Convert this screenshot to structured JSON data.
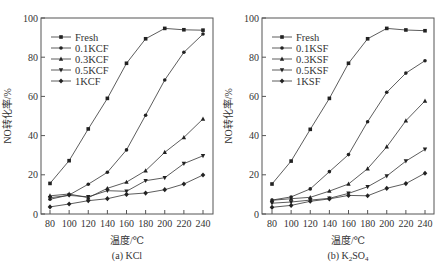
{
  "chart_data": [
    {
      "type": "line",
      "caption": "(a) KCl",
      "xlabel": "温度/℃",
      "ylabel": "NO转化率/%",
      "x": [
        80,
        100,
        120,
        140,
        160,
        180,
        200,
        220,
        240
      ],
      "x_ticks": [
        "80",
        "100",
        "120",
        "140",
        "160",
        "180",
        "200",
        "220",
        "240"
      ],
      "y_ticks": [
        "0",
        "20",
        "40",
        "60",
        "80",
        "100"
      ],
      "ylim": [
        0,
        100
      ],
      "xlim": [
        70,
        250
      ],
      "grid": false,
      "legend_position": "upper left",
      "series": [
        {
          "name": "Fresh",
          "marker": "square",
          "values": [
            15.6,
            27.2,
            43.4,
            59.0,
            76.9,
            89.4,
            94.7,
            94.0,
            93.8
          ]
        },
        {
          "name": "0.1KCF",
          "marker": "circle",
          "values": [
            7.5,
            9.7,
            15.2,
            21.3,
            32.7,
            50.4,
            68.4,
            82.5,
            91.8
          ]
        },
        {
          "name": "0.3KCF",
          "marker": "triangle-up",
          "values": [
            9.3,
            10.2,
            8.3,
            13.1,
            16.3,
            22.1,
            31.5,
            39.1,
            48.5
          ]
        },
        {
          "name": "0.5KCF",
          "marker": "triangle-down",
          "values": [
            8.3,
            9.5,
            8.8,
            11.9,
            11.6,
            17.0,
            18.5,
            25.7,
            29.7
          ]
        },
        {
          "name": "1KCF",
          "marker": "diamond",
          "values": [
            3.6,
            5.1,
            6.8,
            7.8,
            10.0,
            10.7,
            12.4,
            15.3,
            19.9
          ]
        }
      ]
    },
    {
      "type": "line",
      "caption": "(b) K₂SO₄",
      "xlabel": "温度/℃",
      "ylabel": "NO转化率/%",
      "x": [
        80,
        100,
        120,
        140,
        160,
        180,
        200,
        220,
        240
      ],
      "x_ticks": [
        "80",
        "100",
        "120",
        "140",
        "160",
        "180",
        "200",
        "220",
        "240"
      ],
      "y_ticks": [
        "0",
        "20",
        "40",
        "60",
        "80",
        "100"
      ],
      "ylim": [
        0,
        100
      ],
      "xlim": [
        70,
        250
      ],
      "grid": false,
      "legend_position": "upper left",
      "series": [
        {
          "name": "Fresh",
          "marker": "square",
          "values": [
            15.3,
            27.0,
            43.2,
            59.0,
            76.9,
            89.4,
            94.7,
            93.9,
            93.5
          ]
        },
        {
          "name": "0.1KSF",
          "marker": "circle",
          "values": [
            7.1,
            8.7,
            12.8,
            21.6,
            30.3,
            47.1,
            62.1,
            71.9,
            78.2
          ]
        },
        {
          "name": "0.3KSF",
          "marker": "triangle-up",
          "values": [
            7.0,
            7.8,
            8.5,
            11.7,
            15.3,
            23.1,
            34.3,
            47.6,
            57.7
          ]
        },
        {
          "name": "0.5KSF",
          "marker": "triangle-down",
          "values": [
            5.5,
            6.1,
            7.1,
            8.0,
            10.5,
            13.9,
            19.4,
            27.0,
            33.0
          ]
        },
        {
          "name": "1KSF",
          "marker": "diamond",
          "values": [
            3.4,
            4.4,
            6.5,
            7.7,
            9.5,
            9.3,
            13.1,
            15.5,
            20.8
          ]
        }
      ]
    }
  ],
  "panels": {
    "a": {
      "caption": "(a) KCl",
      "xlabel": "温度/℃",
      "ylabel": "NO转化率/%"
    },
    "b": {
      "caption_prefix": "(b) K",
      "caption_sub1": "2",
      "caption_mid": "SO",
      "caption_sub2": "4",
      "xlabel": "温度/℃",
      "ylabel": "NO转化率/%"
    }
  }
}
